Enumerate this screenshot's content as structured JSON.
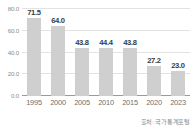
{
  "chart_data": {
    "type": "bar",
    "title": "",
    "subtitle": "",
    "xlabel": "",
    "ylabel": "",
    "categories": [
      "1995",
      "2000",
      "2005",
      "2010",
      "2015",
      "2020",
      "2023"
    ],
    "values": [
      71.5,
      64.0,
      43.8,
      44.4,
      43.8,
      27.2,
      23.0
    ],
    "value_labels": [
      "71.5",
      "64.0",
      "43.8",
      "44.4",
      "43.8",
      "27.2",
      "23.0"
    ],
    "series": [
      {
        "name": "",
        "values": [
          71.5,
          64.0,
          43.8,
          44.4,
          43.8,
          27.2,
          23.0
        ]
      }
    ],
    "ylim": [
      0,
      80
    ],
    "yticks": [
      0,
      20,
      40,
      60,
      80
    ],
    "ytick_labels": [
      "0.0",
      "20.0",
      "40.0",
      "60.0",
      "80.0"
    ],
    "grid": true,
    "legend": false,
    "legend_position": "none",
    "bar_color": "#cfcfcf",
    "gridline_color": "#e2e2e2",
    "baseline_color": "#9a9a9a",
    "value_label_color": "#3b3b3b",
    "tick_label_color": "#6f6f6f",
    "background_color": "#ffffff"
  },
  "footer": {
    "source": "출처: 국가통계포털"
  }
}
